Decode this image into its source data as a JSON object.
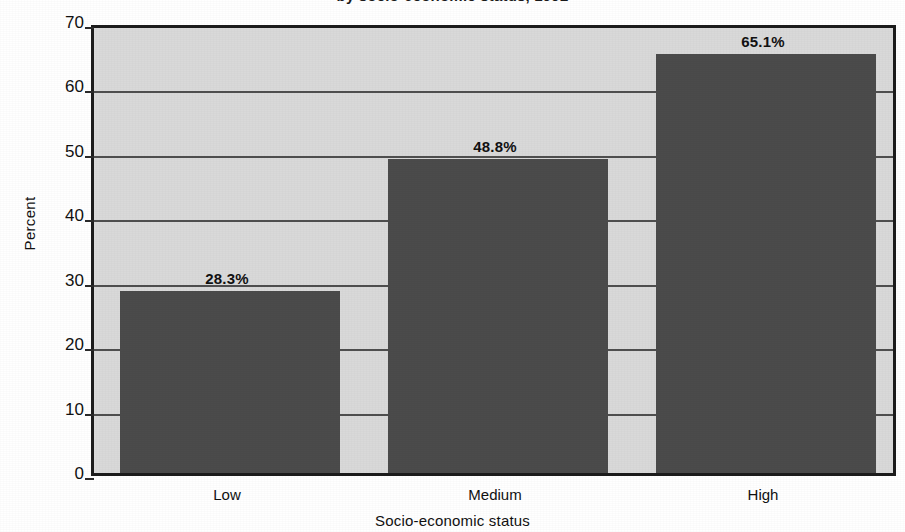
{
  "chart_data": {
    "type": "bar",
    "title": "by socio-economic status, 1992",
    "title_clipped": true,
    "categories": [
      "Low",
      "Medium",
      "High"
    ],
    "values": [
      28.3,
      48.8,
      65.1
    ],
    "data_labels": [
      "28.3%",
      "48.8%",
      "65.1%"
    ],
    "xlabel": "Socio-economic status",
    "ylabel": "Percent",
    "ylim": [
      0,
      70
    ],
    "ytick_labels": [
      "0",
      "10",
      "20",
      "30",
      "40",
      "50",
      "60",
      "70"
    ],
    "ytick_values": [
      0,
      10,
      20,
      30,
      40,
      50,
      60,
      70
    ],
    "grid": "horizontal",
    "legend": "none",
    "colors": {
      "bar_fill": "#4b4b4b",
      "plot_background": "#d9d9d9",
      "frame": "#1c1c1c",
      "gridline": "#4f4f4f",
      "text": "#111111",
      "page_background": "#ffffff"
    }
  }
}
